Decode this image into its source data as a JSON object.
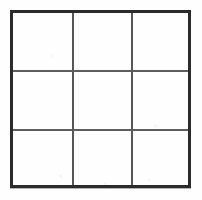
{
  "figure": {
    "kind": "grid-drawing",
    "title": "",
    "caption": "",
    "background_color": "#fefefe",
    "outer_border_color": "#2b2b2b",
    "inner_line_color": "#575757",
    "cell_fill_color": "#ffffff"
  },
  "grid": {
    "rows": 3,
    "columns": 3,
    "cell_count": 9,
    "outer_border_thickness_px": 3,
    "inner_line_thickness_px": 2,
    "bounds": {
      "left_px": 10,
      "top_px": 10,
      "right_px": 191,
      "bottom_px": 188,
      "width_px": 181,
      "height_px": 178
    },
    "vertical_divider_x_px": [
      72,
      131
    ],
    "horizontal_divider_y_px": [
      70,
      129
    ],
    "cells": [
      {
        "row": 1,
        "column": 1,
        "label": "",
        "value": ""
      },
      {
        "row": 1,
        "column": 2,
        "label": "",
        "value": ""
      },
      {
        "row": 1,
        "column": 3,
        "label": "",
        "value": ""
      },
      {
        "row": 2,
        "column": 1,
        "label": "",
        "value": ""
      },
      {
        "row": 2,
        "column": 2,
        "label": "",
        "value": ""
      },
      {
        "row": 2,
        "column": 3,
        "label": "",
        "value": ""
      },
      {
        "row": 3,
        "column": 1,
        "label": "",
        "value": ""
      },
      {
        "row": 3,
        "column": 2,
        "label": "",
        "value": ""
      },
      {
        "row": 3,
        "column": 3,
        "label": "",
        "value": ""
      }
    ]
  }
}
